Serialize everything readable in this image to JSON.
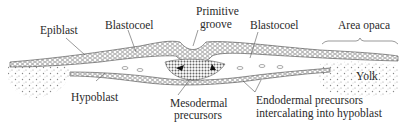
{
  "diagram": {
    "labels": {
      "epiblast": "Epiblast",
      "blastocoel_left": "Blastocoel",
      "primitive_groove_1": "Primitive",
      "primitive_groove_2": "groove",
      "blastocoel_right": "Blastocoel",
      "area_opaca": "Area opaca",
      "hypoblast": "Hypoblast",
      "yolk": "Yolk",
      "mesodermal_1": "Mesodermal",
      "mesodermal_2": "precursors",
      "endodermal_1": "Endodermal precursors",
      "endodermal_2": "intercalating into hypoblast"
    },
    "colors": {
      "ink": "#2a2a2a",
      "background": "#ffffff"
    }
  }
}
